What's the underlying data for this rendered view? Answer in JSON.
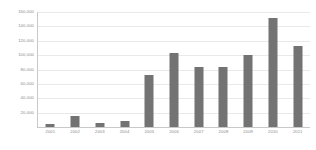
{
  "chart_data": {
    "type": "bar",
    "title": "",
    "subtitle": "",
    "xlabel": "",
    "ylabel": "",
    "categories": [
      "2001",
      "2002",
      "2003",
      "2004",
      "2005",
      "2006",
      "2007",
      "2008",
      "2009",
      "2010",
      "2011"
    ],
    "values": [
      4000,
      15000,
      6000,
      8000,
      73000,
      103000,
      83000,
      84000,
      100000,
      152000,
      113000
    ],
    "series": [
      {
        "name": "",
        "values": [
          4000,
          15000,
          6000,
          8000,
          73000,
          103000,
          83000,
          84000,
          100000,
          152000,
          113000
        ]
      }
    ],
    "ylim": [
      0,
      160000
    ],
    "yticks": [
      20000,
      40000,
      60000,
      80000,
      100000,
      120000,
      140000,
      160000
    ],
    "ytick_labels": [
      "20,000",
      "40,000",
      "60,000",
      "80,000",
      "100,000",
      "120,000",
      "140,000",
      "160,000"
    ],
    "grid": true,
    "legend": false,
    "legend_position": "none",
    "bar_color": "#737373",
    "grid_color": "#e9e9e9",
    "axis_color": "#c8c8c8",
    "tick_label_color": "#8a8a8a",
    "background_color": "#ffffff"
  }
}
